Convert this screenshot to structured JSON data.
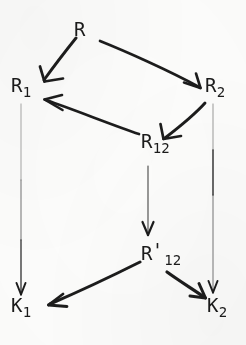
{
  "figure": {
    "kind": "mathematical-commutative-diagram",
    "width": 246,
    "height": 345,
    "background_color": "#fdfdfc",
    "ink_color": "#1b1b1b"
  },
  "nodes": [
    {
      "id": "R",
      "base": "R",
      "sub": "",
      "prime": "",
      "x": 74,
      "y": 20
    },
    {
      "id": "R1",
      "base": "R",
      "sub": "1",
      "prime": "",
      "x": 11,
      "y": 76
    },
    {
      "id": "R2",
      "base": "R",
      "sub": "2",
      "prime": "",
      "x": 205,
      "y": 76
    },
    {
      "id": "R12",
      "base": "R",
      "sub": "12",
      "prime": "",
      "x": 141,
      "y": 132
    },
    {
      "id": "R12prime",
      "base": "R",
      "sub": "12",
      "prime": "'",
      "x": 141,
      "y": 244
    },
    {
      "id": "K1",
      "base": "K",
      "sub": "1",
      "prime": "",
      "x": 11,
      "y": 296
    },
    {
      "id": "K2",
      "base": "K",
      "sub": "2",
      "prime": "",
      "x": 207,
      "y": 296
    }
  ],
  "edges": [
    {
      "id": "R-to-R1",
      "from": "R",
      "to": "R1",
      "style": "thick-diagonal"
    },
    {
      "id": "R-to-R2",
      "from": "R",
      "to": "R2",
      "style": "thick-diagonal"
    },
    {
      "id": "R2-to-R12",
      "from": "R2",
      "to": "R12",
      "style": "thick-diagonal"
    },
    {
      "id": "R12-to-R1",
      "from": "R12",
      "to": "R1",
      "style": "thick-diagonal"
    },
    {
      "id": "R1-to-K1",
      "from": "R1",
      "to": "K1",
      "style": "thin-vertical"
    },
    {
      "id": "R2-to-K2",
      "from": "R2",
      "to": "K2",
      "style": "thin-vertical"
    },
    {
      "id": "R12-to-R12prime",
      "from": "R12",
      "to": "R12prime",
      "style": "thin-vertical"
    },
    {
      "id": "R12prime-to-K1",
      "from": "R12prime",
      "to": "K1",
      "style": "thick-diagonal"
    },
    {
      "id": "R12prime-to-K2",
      "from": "R12prime",
      "to": "K2",
      "style": "thick-diagonal"
    }
  ]
}
